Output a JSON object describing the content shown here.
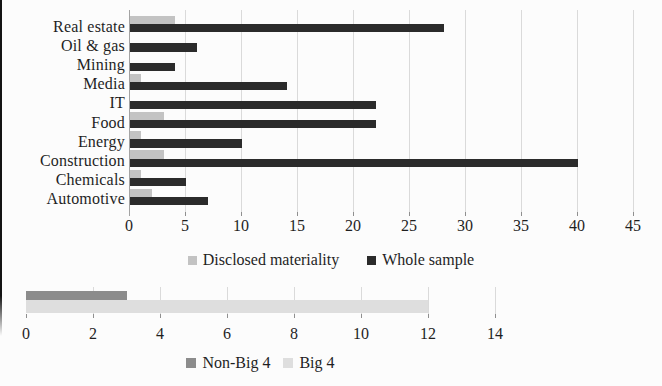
{
  "figure": {
    "background": "#fcfcfc",
    "text_color": "#1f1f1f",
    "gridline_color": "#dadada"
  },
  "chart_data": [
    {
      "type": "bar",
      "orientation": "horizontal",
      "title": "",
      "xlabel": "",
      "ylabel": "",
      "categories": [
        "Real estate",
        "Oil & gas",
        "Mining",
        "Media",
        "IT",
        "Food",
        "Energy",
        "Construction",
        "Chemicals",
        "Automotive"
      ],
      "series": [
        {
          "name": "Disclosed materiality",
          "color": "#c3c3c3",
          "values": [
            4,
            0,
            0,
            1,
            0,
            3,
            1,
            3,
            1,
            2
          ]
        },
        {
          "name": "Whole sample",
          "color": "#2b2b2b",
          "values": [
            28,
            6,
            4,
            14,
            22,
            22,
            10,
            40,
            5,
            7
          ]
        }
      ],
      "xlim": [
        0,
        45
      ],
      "xticks": [
        0,
        5,
        10,
        15,
        20,
        25,
        30,
        35,
        40,
        45
      ],
      "grid": true,
      "legend_position": "bottom"
    },
    {
      "type": "bar",
      "orientation": "horizontal",
      "title": "",
      "xlabel": "",
      "ylabel": "",
      "categories": [
        ""
      ],
      "series": [
        {
          "name": "Non-Big 4",
          "color": "#8c8c8c",
          "values": [
            3
          ]
        },
        {
          "name": "Big 4",
          "color": "#dedede",
          "values": [
            12
          ]
        }
      ],
      "xlim": [
        0,
        14
      ],
      "xticks": [
        0,
        2,
        4,
        6,
        8,
        10,
        12,
        14
      ],
      "grid": true,
      "legend_position": "bottom"
    }
  ]
}
